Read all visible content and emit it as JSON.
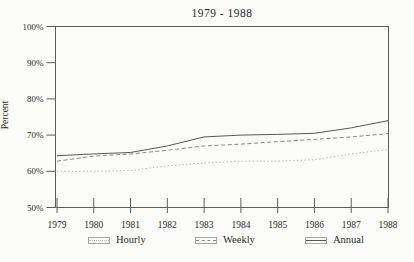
{
  "title": "1979 - 1988",
  "y_axis_title": "Percent",
  "chart_data": {
    "type": "line",
    "title": "1979 - 1988",
    "xlabel": "",
    "ylabel": "Percent",
    "x": [
      1979,
      1980,
      1981,
      1982,
      1983,
      1984,
      1985,
      1986,
      1987,
      1988
    ],
    "series": [
      {
        "name": "Hourly",
        "style": "dotted",
        "color": "#b5b5b5",
        "values": [
          60.0,
          60.0,
          60.2,
          61.5,
          62.3,
          62.8,
          62.8,
          63.2,
          64.8,
          66.0
        ]
      },
      {
        "name": "Weekly",
        "style": "dashed",
        "color": "#8a8a8a",
        "values": [
          62.8,
          64.2,
          64.8,
          65.8,
          67.0,
          67.5,
          68.2,
          68.8,
          69.5,
          70.4
        ]
      },
      {
        "name": "Annual",
        "style": "solid",
        "color": "#585858",
        "values": [
          64.3,
          64.8,
          65.2,
          67.0,
          69.5,
          70.0,
          70.2,
          70.5,
          72.0,
          74.0
        ]
      }
    ],
    "ylim": [
      50,
      100
    ],
    "yticks": [
      50,
      60,
      70,
      80,
      90,
      100
    ],
    "ytick_labels": [
      "50%",
      "60%",
      "70%",
      "80%",
      "90%",
      "100%"
    ],
    "grid": false,
    "legend_position": "bottom",
    "frame_color": "#5e5e5e"
  },
  "legend": {
    "items": [
      {
        "label": "Hourly"
      },
      {
        "label": "Weekly"
      },
      {
        "label": "Annual"
      }
    ]
  }
}
